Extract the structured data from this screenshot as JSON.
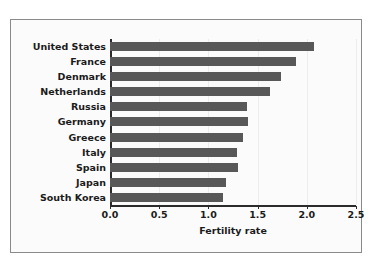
{
  "figure": {
    "background_color": "#fbfbfb",
    "frame_color": "#8a8a8a",
    "bar_color": "#585858",
    "text_color": "#1b1b1b",
    "gridline_color": "#ececec"
  },
  "chart_data": {
    "type": "bar",
    "orientation": "horizontal",
    "title": "",
    "xlabel": "Fertility rate",
    "ylabel": "",
    "xlim": [
      0.0,
      2.5
    ],
    "xticks": [
      "0.0",
      "0.5",
      "1.0",
      "1.5",
      "2.0",
      "2.5"
    ],
    "xtick_values": [
      0.0,
      0.5,
      1.0,
      1.5,
      2.0,
      2.5
    ],
    "grid": true,
    "legend": false,
    "categories": [
      "United States",
      "France",
      "Denmark",
      "Netherlands",
      "Russia",
      "Germany",
      "Greece",
      "Italy",
      "Spain",
      "Japan",
      "South Korea"
    ],
    "values": [
      2.07,
      1.89,
      1.74,
      1.63,
      1.39,
      1.4,
      1.35,
      1.29,
      1.3,
      1.18,
      1.15
    ]
  }
}
